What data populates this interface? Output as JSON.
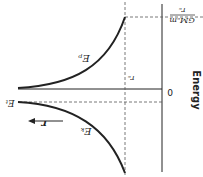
{
  "diagram": {
    "rotation_deg": 180,
    "y_axis_label": "Energy",
    "zero_label": "0",
    "top_value_label_num": "GMₑm",
    "top_value_label_den": "rₑ",
    "re_label": "rₑ",
    "ep_label": "Eₚ",
    "ek_label": "Eₖ",
    "et_label": "Eₜ",
    "r_label": "r",
    "colors": {
      "line": "#222222",
      "dashed": "#555555"
    }
  }
}
